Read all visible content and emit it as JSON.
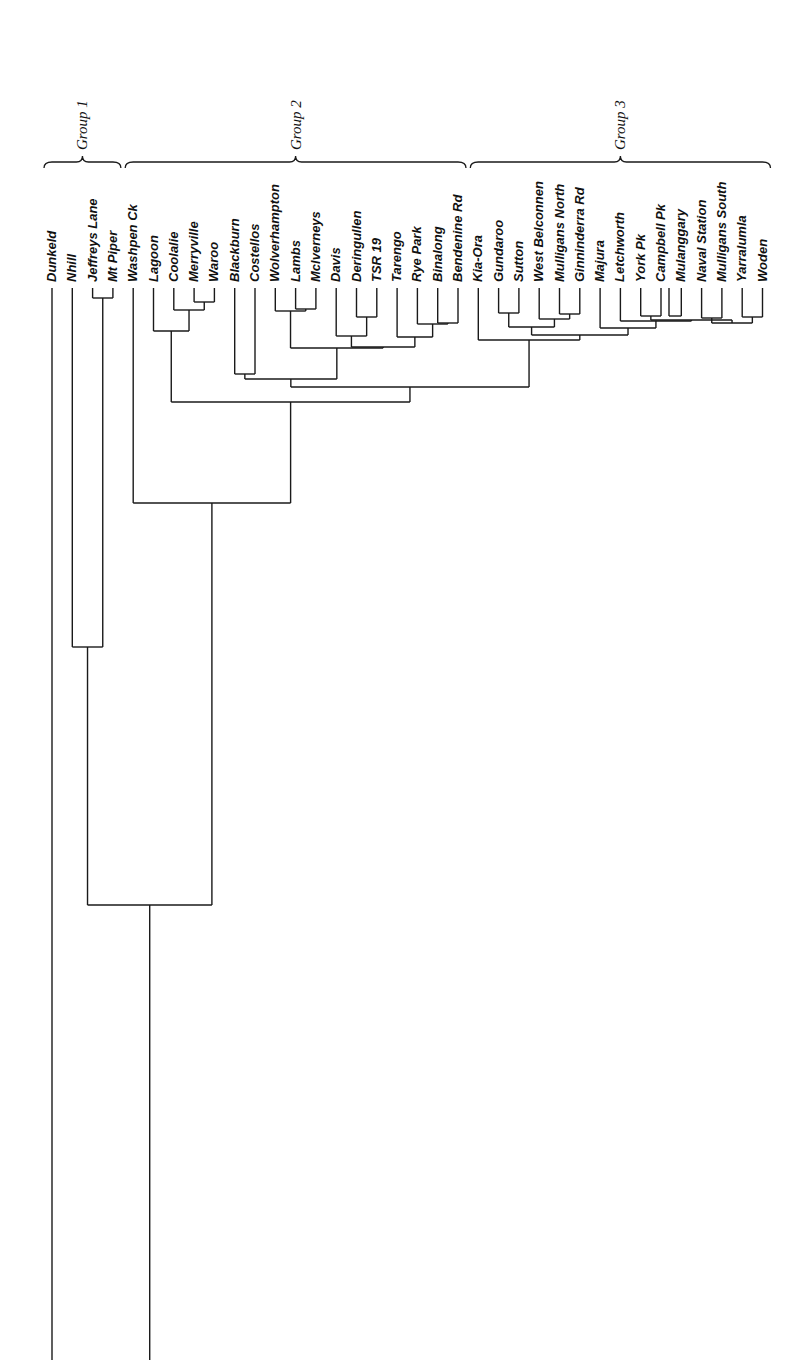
{
  "chart_data": {
    "type": "dendrogram",
    "orientation": "vertical, leaves at top, rotated labels",
    "leaves": [
      "Dunkeld",
      "Nhill",
      "Jeffreys Lane",
      "Mt Piper",
      "Washpen Ck",
      "Lagoon",
      "Coolalie",
      "Merryville",
      "Waroo",
      "Blackburn",
      "Costellos",
      "Wolverhampton",
      "Lambs",
      "Mclverneys",
      "Davis",
      "Deringullen",
      "TSR 19",
      "Tarengo",
      "Rye Park",
      "Binalong",
      "Bendenine Rd",
      "Kia-Ora",
      "Gundaroo",
      "Sutton",
      "West Belconnen",
      "Mulligans North",
      "Ginninderra Rd",
      "Majura",
      "Letchworth",
      "York Pk",
      "Campbell Pk",
      "Mulanggary",
      "Naval Station",
      "Mulligans South",
      "Yarralumla",
      "Woden"
    ],
    "groups": [
      {
        "label": "Group 1",
        "from": 0,
        "to": 3
      },
      {
        "label": "Group 2",
        "from": 4,
        "to": 20
      },
      {
        "label": "Group 3",
        "from": 21,
        "to": 35
      }
    ],
    "merges": [
      {
        "id": "n1",
        "a": "L2",
        "b": "L3",
        "y": 298
      },
      {
        "id": "n2",
        "a": "L7",
        "b": "L8",
        "y": 302
      },
      {
        "id": "n3",
        "a": "L6",
        "b": "n2",
        "y": 310
      },
      {
        "id": "n4",
        "a": "L5",
        "b": "n3",
        "y": 331
      },
      {
        "id": "n5",
        "a": "L12",
        "b": "L13",
        "y": 309
      },
      {
        "id": "n6",
        "a": "L11",
        "b": "n5",
        "y": 311
      },
      {
        "id": "n7",
        "a": "L15",
        "b": "L16",
        "y": 317
      },
      {
        "id": "n8",
        "a": "L14",
        "b": "n7",
        "y": 336
      },
      {
        "id": "n9",
        "a": "L19",
        "b": "L20",
        "y": 323
      },
      {
        "id": "n10",
        "a": "L18",
        "b": "n9",
        "y": 324
      },
      {
        "id": "n11",
        "a": "L17",
        "b": "n10",
        "y": 337
      },
      {
        "id": "n12",
        "a": "n8",
        "b": "n11",
        "y": 347
      },
      {
        "id": "n13",
        "a": "n6",
        "b": "n12",
        "y": 348
      },
      {
        "id": "n14",
        "a": "L9",
        "b": "L10",
        "y": 374
      },
      {
        "id": "n15",
        "a": "n14",
        "b": "n13",
        "y": 379
      },
      {
        "id": "n16",
        "a": "L22",
        "b": "L23",
        "y": 313
      },
      {
        "id": "n17",
        "a": "L25",
        "b": "L26",
        "y": 314
      },
      {
        "id": "n18",
        "a": "L24",
        "b": "n17",
        "y": 319
      },
      {
        "id": "n19",
        "a": "n16",
        "b": "n18",
        "y": 327
      },
      {
        "id": "n20",
        "a": "L29",
        "b": "L30",
        "y": 316
      },
      {
        "id": "n21",
        "a": "L31",
        "b": "L30b",
        "y": 316
      },
      {
        "id": "n22",
        "a": "L32",
        "b": "L33",
        "y": 318
      },
      {
        "id": "n23",
        "a": "L34",
        "b": "L35",
        "y": 317
      },
      {
        "id": "n24",
        "a": "n22",
        "b": "n23",
        "y": 323
      },
      {
        "id": "n25",
        "a": "n20",
        "b": "n24",
        "y": 320
      },
      {
        "id": "n26",
        "a": "L28",
        "b": "n25",
        "y": 321
      },
      {
        "id": "n27",
        "a": "L27",
        "b": "n26",
        "y": 328
      },
      {
        "id": "n28",
        "a": "n19",
        "b": "n27",
        "y": 335
      },
      {
        "id": "n29",
        "a": "L21",
        "b": "n28",
        "y": 340
      },
      {
        "id": "n30",
        "a": "n15",
        "b": "n29",
        "y": 387
      },
      {
        "id": "n31",
        "a": "n4",
        "b": "n30",
        "y": 402
      },
      {
        "id": "n32",
        "a": "L4",
        "b": "n31",
        "y": 503
      },
      {
        "id": "n33",
        "a": "L1",
        "b": "n1",
        "y": 647
      },
      {
        "id": "n34",
        "a": "n33",
        "b": "n32",
        "y": 905
      }
    ],
    "root_lines_extend_to": 1360,
    "note": "Dunkeld (L0) and the n34 cluster both extend to bottom edge without a visible final join"
  }
}
